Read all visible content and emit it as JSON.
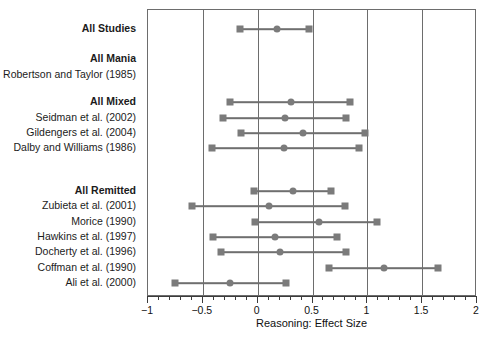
{
  "chart_data": {
    "type": "scatter",
    "plot_kind": "forest-plot",
    "title": "",
    "xlabel": "Reasoning: Effect Size",
    "ylabel": "",
    "xlim": [
      -1,
      2
    ],
    "xticks": [
      -1,
      -0.5,
      0,
      0.5,
      1,
      1.5,
      2
    ],
    "xticklabels": [
      "−1",
      "−0.5",
      "0",
      "0.5",
      "1",
      "1.5",
      "2"
    ],
    "minor_tick_step": 0.1,
    "grid": "vertical-at-major-ticks",
    "legend": "none",
    "marker_color": "#7b7b7b",
    "line_color": "#6f6f6f",
    "frame_color": "#6d6d6d",
    "rows": [
      {
        "label": "All Studies",
        "group": true,
        "estimate": 0.18,
        "ci_low": -0.16,
        "ci_high": 0.47
      },
      {
        "label": "All Mania",
        "group": true,
        "estimate": null,
        "ci_low": null,
        "ci_high": null
      },
      {
        "label": "Robertson and Taylor (1985)",
        "group": false,
        "estimate": null,
        "ci_low": null,
        "ci_high": null
      },
      {
        "label": "All Mixed",
        "group": true,
        "estimate": 0.3,
        "ci_low": -0.25,
        "ci_high": 0.84
      },
      {
        "label": "Seidman et al. (2002)",
        "group": false,
        "estimate": 0.25,
        "ci_low": -0.32,
        "ci_high": 0.81
      },
      {
        "label": "Gildengers et al. (2004)",
        "group": false,
        "estimate": 0.41,
        "ci_low": -0.15,
        "ci_high": 0.98
      },
      {
        "label": "Dalby and Williams (1986)",
        "group": false,
        "estimate": 0.24,
        "ci_low": -0.42,
        "ci_high": 0.92
      },
      {
        "label": "All Remitted",
        "group": true,
        "estimate": 0.32,
        "ci_low": -0.03,
        "ci_high": 0.67
      },
      {
        "label": "Zubieta et al. (2001)",
        "group": false,
        "estimate": 0.1,
        "ci_low": -0.6,
        "ci_high": 0.8
      },
      {
        "label": "Morice (1990)",
        "group": false,
        "estimate": 0.56,
        "ci_low": -0.02,
        "ci_high": 1.09
      },
      {
        "label": "Hawkins et al. (1997)",
        "group": false,
        "estimate": 0.16,
        "ci_low": -0.41,
        "ci_high": 0.72
      },
      {
        "label": "Docherty et al. (1996)",
        "group": false,
        "estimate": 0.2,
        "ci_low": -0.33,
        "ci_high": 0.81
      },
      {
        "label": "Coffman et al. (1990)",
        "group": false,
        "estimate": 1.15,
        "ci_low": 0.65,
        "ci_high": 1.64
      },
      {
        "label": "Ali et al. (2000)",
        "group": false,
        "estimate": -0.25,
        "ci_low": -0.75,
        "ci_high": 0.26
      }
    ],
    "row_y_px": [
      28,
      58,
      74,
      101,
      117,
      132,
      147,
      190,
      205,
      221,
      236,
      251,
      267,
      282
    ]
  }
}
